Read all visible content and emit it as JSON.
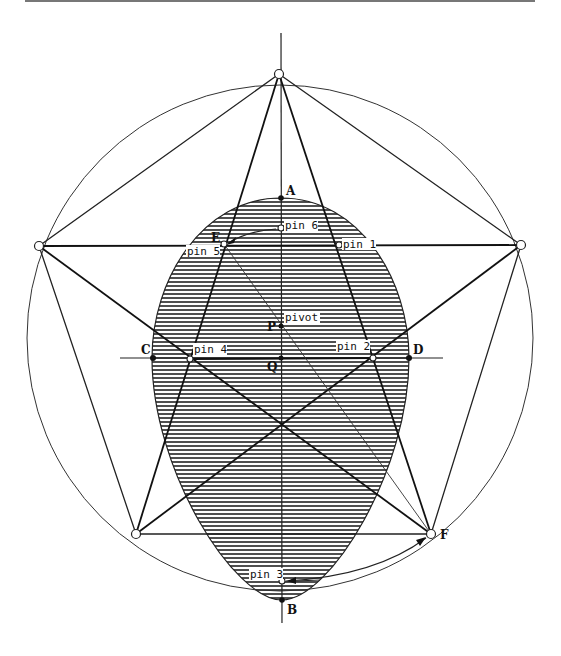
{
  "figure": {
    "points": {
      "A": {
        "label": "A",
        "x": 281,
        "y": 198
      },
      "B": {
        "label": "B",
        "x": 282,
        "y": 600
      },
      "C": {
        "label": "C",
        "x": 153,
        "y": 358
      },
      "D": {
        "label": "D",
        "x": 409,
        "y": 358
      },
      "E": {
        "label": "E",
        "x": 224,
        "y": 244
      },
      "F": {
        "label": "F",
        "x": 431,
        "y": 534
      },
      "P": {
        "label": "P",
        "x": 281,
        "y": 326
      },
      "Q": {
        "label": "Q",
        "x": 281,
        "y": 358
      }
    },
    "pins": {
      "pin1": {
        "label": "pin 1",
        "x": 339,
        "y": 245
      },
      "pin2": {
        "label": "pin 2",
        "x": 373,
        "y": 358
      },
      "pin3": {
        "label": "pin 3",
        "x": 282,
        "y": 581
      },
      "pin4": {
        "label": "pin 4",
        "x": 190,
        "y": 359
      },
      "pin5": {
        "label": "pin 5",
        "x": 224,
        "y": 244
      },
      "pin6": {
        "label": "pin 6",
        "x": 281,
        "y": 228
      },
      "pivot": {
        "label": "pivot",
        "x": 281,
        "y": 326
      }
    },
    "pentagon_vertices": [
      {
        "x": 279,
        "y": 74
      },
      {
        "x": 521,
        "y": 245
      },
      {
        "x": 431,
        "y": 534
      },
      {
        "x": 136,
        "y": 534
      },
      {
        "x": 39,
        "y": 246
      }
    ],
    "circle": {
      "cx": 280,
      "cy": 322,
      "r": 252
    }
  }
}
